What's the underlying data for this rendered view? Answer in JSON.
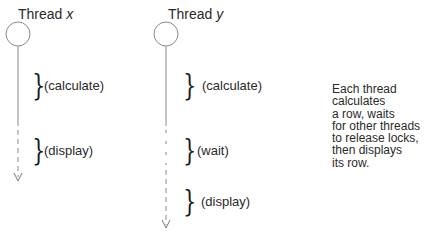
{
  "threads": [
    {
      "title_prefix": "Thread",
      "title_var": "x",
      "phases": [
        {
          "label": "(calculate)"
        },
        {
          "label": "(display)"
        }
      ]
    },
    {
      "title_prefix": "Thread",
      "title_var": "y",
      "phases": [
        {
          "label": "(calculate)"
        },
        {
          "label": "(wait)"
        },
        {
          "label": "(display)"
        }
      ]
    }
  ],
  "brace_glyph": "}",
  "note": {
    "lines": [
      "Each thread",
      "calculates",
      "a row, waits",
      "for other threads",
      "to release locks,",
      "then displays",
      "its row."
    ]
  },
  "colors": {
    "line": "#8a8a8a",
    "text": "#2a2a2a",
    "background": "#ffffff"
  }
}
